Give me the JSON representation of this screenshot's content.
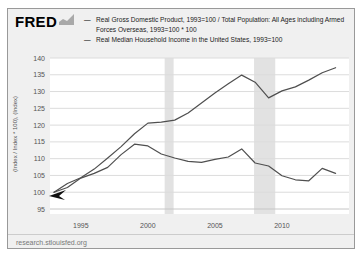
{
  "header": {
    "logo_text": "FRED",
    "logo_icon": "fred-graph-icon"
  },
  "footer": {
    "url": "research.stlouisfed.org"
  },
  "colors": {
    "line": "#4f4f4f",
    "recession_band": "#e2e2e2",
    "gridline": "#dcdcdc",
    "axis_line": "#c6c6c6",
    "axis_text": "#555555",
    "plot_background": "#ffffff",
    "widget_background": "#f0f0f0",
    "border": "#999999"
  },
  "chart_data": {
    "type": "line",
    "title": "",
    "xlabel": "",
    "ylabel": "(Index / Index * 100), (Index)",
    "legend_position": "top",
    "grid": true,
    "xlim": [
      1992.7,
      2015
    ],
    "ylim": [
      95,
      140
    ],
    "x_ticks": [
      "1995",
      "2000",
      "2005",
      "2010"
    ],
    "x_tick_values": [
      1995,
      2000,
      2005,
      2010
    ],
    "y_ticks": [
      "95",
      "100",
      "105",
      "110",
      "115",
      "120",
      "125",
      "130",
      "135",
      "140"
    ],
    "y_tick_values": [
      95,
      100,
      105,
      110,
      115,
      120,
      125,
      130,
      135,
      140
    ],
    "recessions": [
      [
        2001.25,
        2001.92
      ],
      [
        2007.92,
        2009.5
      ]
    ],
    "x": [
      1993,
      1994,
      1995,
      1996,
      1997,
      1998,
      1999,
      2000,
      2001,
      2002,
      2003,
      2004,
      2005,
      2006,
      2007,
      2008,
      2009,
      2010,
      2011,
      2012,
      2013,
      2014
    ],
    "series": [
      {
        "name": "Real Gross Domestic Product, 1993=100 / Total Population: All Ages including Armed Forces Overseas, 1993=100 * 100",
        "color": "#4f4f4f",
        "values": [
          100,
          102.6,
          104.3,
          106.9,
          110.2,
          113.6,
          117.4,
          120.6,
          120.9,
          121.5,
          123.6,
          126.6,
          129.6,
          132.3,
          134.9,
          132.8,
          128.1,
          130.2,
          131.4,
          133.4,
          135.6,
          137.1
        ]
      },
      {
        "name": "Real Median Household Income in the United States, 1993=100",
        "color": "#4f4f4f",
        "values": [
          100,
          101.4,
          104.2,
          105.6,
          107.4,
          111.2,
          114.3,
          113.8,
          111.4,
          110.2,
          109.2,
          108.9,
          109.8,
          110.5,
          112.9,
          108.7,
          107.8,
          104.9,
          103.7,
          103.4,
          107.1,
          105.6
        ]
      }
    ]
  }
}
